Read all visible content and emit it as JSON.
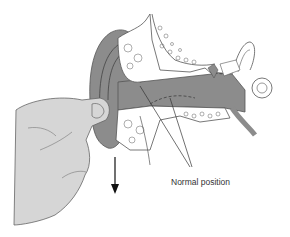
{
  "figure": {
    "labels": {
      "normal_position": "Normal position"
    },
    "icons": {
      "arrow": "down-arrow-icon"
    },
    "colors": {
      "canal_fill": "#8c8c8c",
      "bone_fill": "#ffffff",
      "hand_fill": "#d6d6d6",
      "outline": "#555555",
      "arrow": "#111111"
    }
  }
}
